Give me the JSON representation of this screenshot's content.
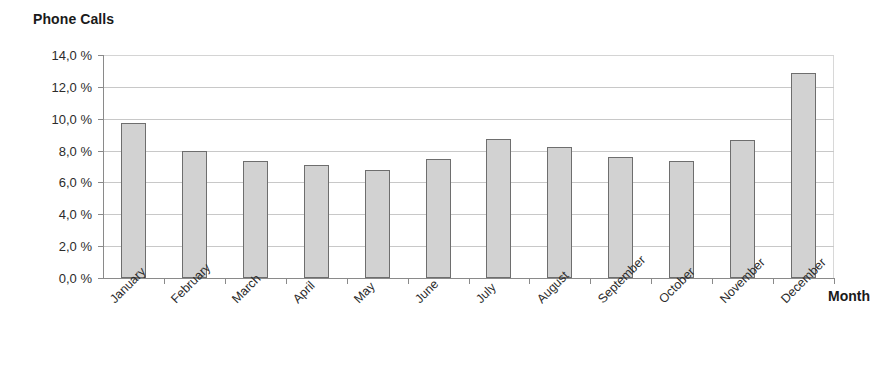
{
  "chart_data": {
    "type": "bar",
    "title": "Phone Calls",
    "xlabel": "Month",
    "ylabel": "",
    "categories": [
      "January",
      "February",
      "March",
      "April",
      "May",
      "June",
      "July",
      "August",
      "September",
      "October",
      "November",
      "December"
    ],
    "values": [
      9.7,
      8.0,
      7.35,
      7.1,
      6.75,
      7.5,
      8.7,
      8.25,
      7.6,
      7.35,
      8.65,
      12.85
    ],
    "value_suffix": " %",
    "ylim": [
      0.0,
      14.0
    ],
    "ytick_values": [
      0.0,
      2.0,
      4.0,
      6.0,
      8.0,
      10.0,
      12.0,
      14.0
    ],
    "ytick_labels": [
      "0,0 %",
      "2,0 %",
      "4,0 %",
      "6,0 %",
      "8,0 %",
      "10,0 %",
      "12,0 %",
      "14,0 %"
    ],
    "grid": true,
    "legend": null,
    "bar_fill_color": "#d2d2d2",
    "bar_border_color": "#6e6e6e",
    "gridline_color": "#c8c8c8",
    "axis_color": "#8a8a8a",
    "text_color": "#2b2b2b",
    "label_rotation_degrees": 45
  }
}
